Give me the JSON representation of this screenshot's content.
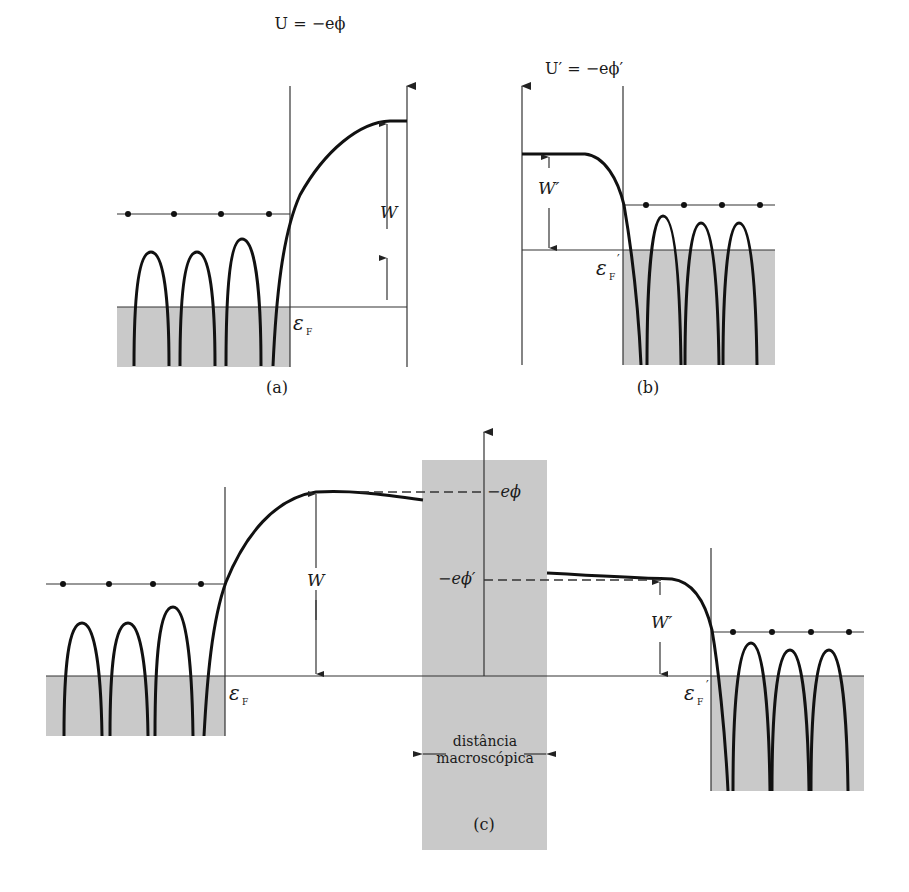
{
  "figure": {
    "panel_a": {
      "caption": "(a)",
      "title": "U = −eϕ",
      "gap_label": "W",
      "fermi_label": "ε",
      "fermi_sub": "F"
    },
    "panel_b": {
      "caption": "(b)",
      "title": "U′ = −eϕ′",
      "gap_label": "W′",
      "fermi_label": "ε",
      "fermi_sub": "F",
      "fermi_prime": "′"
    },
    "panel_c": {
      "caption": "(c)",
      "left_gap_label": "W",
      "right_gap_label": "W′",
      "left_fermi_label": "ε",
      "left_fermi_sub": "F",
      "right_fermi_label": "ε",
      "right_fermi_sub": "F",
      "right_fermi_prime": "′",
      "level_left": "−eϕ",
      "level_right": "−eϕ′",
      "region_label_line1": "distância",
      "region_label_line2": "macroscópica"
    },
    "colors": {
      "shade": "#c9c9c9",
      "curve": "#111111"
    }
  }
}
